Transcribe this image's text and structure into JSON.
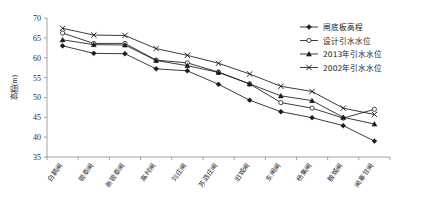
{
  "chart_data": {
    "type": "line",
    "title": "",
    "xlabel": "",
    "ylabel": "高程(m)",
    "ylim": [
      35,
      70
    ],
    "ytick_step": 5,
    "yticks": [
      35,
      40,
      45,
      50,
      55,
      60,
      65,
      70
    ],
    "grid": false,
    "legend_position": "top-right",
    "categories": [
      "白鹤闸",
      "银泰闸",
      "新银泰闸",
      "高村闸",
      "刘庄闸",
      "苏泗庄闸",
      "旧城闸",
      "东闸闸",
      "杨集闸",
      "殷城闸",
      "闸寨甘闸"
    ],
    "series": [
      {
        "name": "闸底板高程",
        "marker": "filled-diamond",
        "values": [
          63.0,
          61.1,
          61.0,
          57.2,
          56.7,
          53.3,
          49.3,
          46.4,
          44.9,
          42.9,
          39.0
        ]
      },
      {
        "name": "设计引水水位",
        "marker": "open-circle",
        "values": [
          66.2,
          63.6,
          63.6,
          59.4,
          58.7,
          56.4,
          53.4,
          48.7,
          47.3,
          44.8,
          47.0
        ]
      },
      {
        "name": "2013年引水水位",
        "marker": "filled-triangle",
        "values": [
          64.5,
          63.3,
          63.2,
          59.3,
          58.0,
          56.3,
          53.4,
          50.4,
          49.2,
          45.0,
          43.3
        ]
      },
      {
        "name": "2002年引水水位",
        "marker": "cross-x",
        "values": [
          67.4,
          65.7,
          65.6,
          62.3,
          60.6,
          58.6,
          55.9,
          52.8,
          51.5,
          47.3,
          45.7
        ]
      }
    ]
  },
  "colors": {
    "ink": "#1a1a1a",
    "axis": "#8a8a8a",
    "background": "#ffffff"
  }
}
